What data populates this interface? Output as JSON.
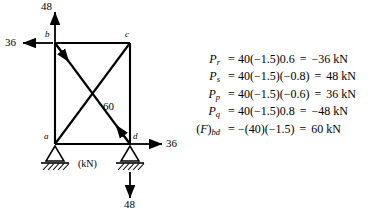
{
  "figure": {
    "unit_label": "(kN)",
    "nodes": [
      {
        "id": "b",
        "label": "b"
      },
      {
        "id": "c",
        "label": "c"
      },
      {
        "id": "a",
        "label": "a"
      },
      {
        "id": "d",
        "label": "d"
      }
    ],
    "member_force_label": "60",
    "forces": [
      {
        "id": "b-vertical",
        "value": "48",
        "direction": "up",
        "at": "b"
      },
      {
        "id": "b-horizontal",
        "value": "36",
        "direction": "left",
        "at": "b"
      },
      {
        "id": "d-horizontal",
        "value": "36",
        "direction": "right",
        "at": "d"
      },
      {
        "id": "d-vertical",
        "value": "48",
        "direction": "down",
        "at": "d"
      }
    ],
    "supports": [
      {
        "id": "support-a",
        "type": "pin"
      },
      {
        "id": "support-d",
        "type": "pin"
      }
    ]
  },
  "equations": [
    {
      "symbol": "P",
      "subscript": "r",
      "lhs_open": "",
      "lhs_close": "",
      "eq1": "=",
      "expression": "40(−1.5)0.6",
      "eq2": "=",
      "result": "−36 kN"
    },
    {
      "symbol": "P",
      "subscript": "s",
      "lhs_open": "",
      "lhs_close": "",
      "eq1": "=",
      "expression": "40(−1.5)(−0.8)",
      "eq2": "=",
      "result": "48 kN"
    },
    {
      "symbol": "P",
      "subscript": "p",
      "lhs_open": "",
      "lhs_close": "",
      "eq1": "=",
      "expression": "40(−1.5)(−0.6)",
      "eq2": "=",
      "result": "36 kN"
    },
    {
      "symbol": "P",
      "subscript": "q",
      "lhs_open": "",
      "lhs_close": "",
      "eq1": "=",
      "expression": "40(−1.5)0.8",
      "eq2": "=",
      "result": "−48 kN"
    },
    {
      "symbol": "F",
      "subscript": "bd",
      "lhs_open": "(",
      "lhs_close": ")",
      "eq1": "=",
      "expression": "−(40)(−1.5)",
      "eq2": "=",
      "result": "60 kN"
    }
  ],
  "colors": {
    "ink": "#000000",
    "background": "#ffffff"
  }
}
